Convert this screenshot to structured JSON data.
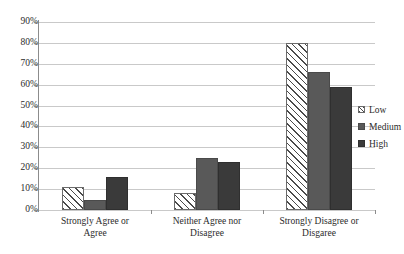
{
  "chart_data": {
    "type": "bar",
    "title": "",
    "subtitle": "",
    "xlabel": "",
    "ylabel": "",
    "categories": [
      "Strongly Agree or Agree",
      "Neither Agree nor Disagree",
      "Strongly Disagree or Disgaree"
    ],
    "category_lines": [
      [
        "Strongly Agree or",
        "Agree"
      ],
      [
        "Neither Agree nor",
        "Disagree"
      ],
      [
        "Strongly Disagree or",
        "Disgaree"
      ]
    ],
    "series": [
      {
        "name": "Low",
        "values": [
          11,
          8,
          80
        ]
      },
      {
        "name": "Medium",
        "values": [
          5,
          25,
          66
        ]
      },
      {
        "name": "High",
        "values": [
          16,
          23,
          59
        ]
      }
    ],
    "ylim": [
      0,
      90
    ],
    "ytick_values": [
      0,
      10,
      20,
      30,
      40,
      50,
      60,
      70,
      80,
      90
    ],
    "ytick_labels": [
      "0%",
      "10%",
      "20%",
      "30%",
      "40%",
      "50%",
      "60%",
      "70%",
      "80%",
      "90%"
    ],
    "grid": true,
    "grid_axis": "y",
    "legend_position": "right",
    "legend_entries": [
      "Low",
      "Medium",
      "High"
    ],
    "colors": {
      "low": "#ffffff",
      "low_hatch": "#4a4a4a",
      "medium": "#595959",
      "high": "#3a3a3a",
      "gridline": "#c9c9c9",
      "axis": "#8c8c8c",
      "text": "#2b2b2b",
      "background": "#ffffff"
    }
  }
}
